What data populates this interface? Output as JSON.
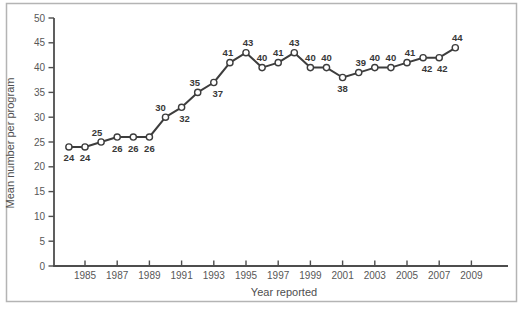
{
  "figure": {
    "background": "#ffffff",
    "border_color": "#b4b4b4"
  },
  "chart_data": {
    "type": "line",
    "title": "",
    "xlabel": "Year reported",
    "ylabel": "Mean number per program",
    "ylim": [
      0,
      50
    ],
    "y_ticks": [
      0,
      5,
      10,
      15,
      20,
      25,
      30,
      35,
      40,
      45,
      50
    ],
    "x_tick_labels": [
      "1985",
      "1987",
      "1989",
      "1991",
      "1993",
      "1995",
      "1997",
      "1999",
      "2001",
      "2003",
      "2005",
      "2007",
      "2009"
    ],
    "grid": false,
    "legend": "none",
    "marker": "open-circle",
    "series": [
      {
        "name": "Mean number per program",
        "points": [
          {
            "year": 1984,
            "value": 24,
            "label": "24",
            "label_pos": "below",
            "dx": 0
          },
          {
            "year": 1985,
            "value": 24,
            "label": "24",
            "label_pos": "below",
            "dx": 0
          },
          {
            "year": 1986,
            "value": 25,
            "label": "25",
            "label_pos": "above",
            "dx": -4
          },
          {
            "year": 1987,
            "value": 26,
            "label": "26",
            "label_pos": "below",
            "dx": 0
          },
          {
            "year": 1988,
            "value": 26,
            "label": "26",
            "label_pos": "below",
            "dx": 0
          },
          {
            "year": 1989,
            "value": 26,
            "label": "26",
            "label_pos": "below",
            "dx": 0
          },
          {
            "year": 1990,
            "value": 30,
            "label": "30",
            "label_pos": "above",
            "dx": -5
          },
          {
            "year": 1991,
            "value": 32,
            "label": "32",
            "label_pos": "below",
            "dx": 3
          },
          {
            "year": 1992,
            "value": 35,
            "label": "35",
            "label_pos": "above",
            "dx": -3
          },
          {
            "year": 1993,
            "value": 37,
            "label": "37",
            "label_pos": "below",
            "dx": 4
          },
          {
            "year": 1994,
            "value": 41,
            "label": "41",
            "label_pos": "above",
            "dx": -2
          },
          {
            "year": 1995,
            "value": 43,
            "label": "43",
            "label_pos": "above",
            "dx": 2
          },
          {
            "year": 1996,
            "value": 40,
            "label": "40",
            "label_pos": "above",
            "dx": 0
          },
          {
            "year": 1997,
            "value": 41,
            "label": "41",
            "label_pos": "above",
            "dx": 0
          },
          {
            "year": 1998,
            "value": 43,
            "label": "43",
            "label_pos": "above",
            "dx": 0
          },
          {
            "year": 1999,
            "value": 40,
            "label": "40",
            "label_pos": "above",
            "dx": 0
          },
          {
            "year": 2000,
            "value": 40,
            "label": "40",
            "label_pos": "above",
            "dx": 0
          },
          {
            "year": 2001,
            "value": 38,
            "label": "38",
            "label_pos": "below",
            "dx": 0
          },
          {
            "year": 2002,
            "value": 39,
            "label": "39",
            "label_pos": "above",
            "dx": 2
          },
          {
            "year": 2003,
            "value": 40,
            "label": "40",
            "label_pos": "above",
            "dx": 0
          },
          {
            "year": 2004,
            "value": 40,
            "label": "40",
            "label_pos": "above",
            "dx": 0
          },
          {
            "year": 2005,
            "value": 41,
            "label": "41",
            "label_pos": "above",
            "dx": 3
          },
          {
            "year": 2006,
            "value": 42,
            "label": "42",
            "label_pos": "below",
            "dx": 4
          },
          {
            "year": 2007,
            "value": 42,
            "label": "42",
            "label_pos": "below",
            "dx": 3
          },
          {
            "year": 2008,
            "value": 44,
            "label": "44",
            "label_pos": "above",
            "dx": 2
          }
        ]
      }
    ],
    "colors": {
      "line": "#3d3d3d",
      "marker_fill": "#ffffff",
      "marker_stroke": "#3d3d3d",
      "axis": "#4d4d4d",
      "tick_text": "#575757",
      "point_label_text": "#383838"
    }
  }
}
